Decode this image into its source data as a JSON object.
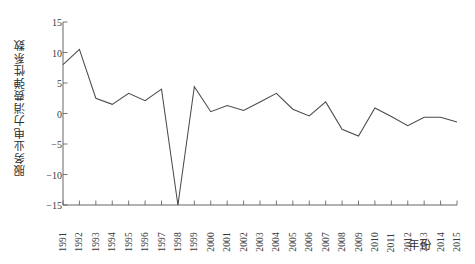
{
  "chart_data": {
    "type": "line",
    "title": "",
    "xlabel": "年份",
    "ylabel": "服务业电力消费弹性系数",
    "xlim": [
      1991,
      2015
    ],
    "ylim": [
      -15,
      15
    ],
    "grid": false,
    "legend": "none",
    "x": [
      1991,
      1992,
      1993,
      1994,
      1995,
      1996,
      1997,
      1998,
      1999,
      2000,
      2001,
      2002,
      2003,
      2004,
      2005,
      2006,
      2007,
      2008,
      2009,
      2010,
      2011,
      2012,
      2013,
      2014,
      2015
    ],
    "categories": [
      "1991",
      "1992",
      "1993",
      "1994",
      "1995",
      "1996",
      "1997",
      "1998",
      "1999",
      "2000",
      "2001",
      "2002",
      "2003",
      "2004",
      "2005",
      "2006",
      "2007",
      "2008",
      "2009",
      "2010",
      "2011",
      "2012",
      "2013",
      "2014",
      "2015"
    ],
    "values": [
      8.0,
      10.5,
      2.5,
      1.5,
      3.3,
      2.1,
      4.0,
      -15.0,
      4.4,
      0.3,
      1.3,
      0.5,
      1.9,
      3.3,
      0.7,
      -0.4,
      1.9,
      -2.6,
      -3.7,
      0.9,
      -0.5,
      -2.0,
      -0.6,
      -0.6,
      -1.4
    ],
    "series": [
      {
        "name": "服务业电力消费弹性系数",
        "values": [
          8.0,
          10.5,
          2.5,
          1.5,
          3.3,
          2.1,
          4.0,
          -15.0,
          4.4,
          0.3,
          1.3,
          0.5,
          1.9,
          3.3,
          0.7,
          -0.4,
          1.9,
          -2.6,
          -3.7,
          0.9,
          -0.5,
          -2.0,
          -0.6,
          -0.6,
          -1.4
        ]
      }
    ],
    "yticks": [
      15,
      10,
      5,
      0,
      -5,
      -10,
      -15
    ],
    "ytick_labels": [
      "15",
      "10",
      "5",
      "0",
      "−5",
      "−10",
      "−15"
    ],
    "line_color": "#4a4a4a",
    "axis_color": "#555555",
    "background_color": "#ffffff"
  }
}
